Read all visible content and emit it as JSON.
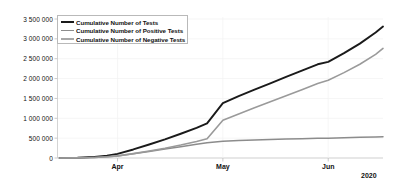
{
  "chart_data": {
    "type": "line",
    "title": "",
    "xlabel": "",
    "ylabel": "",
    "year_label": "2020",
    "ylim": [
      0,
      3500000
    ],
    "grid": true,
    "legend_position": "upper-left-inside",
    "y_ticks": [
      "0",
      "500 000",
      "1 000 000",
      "1 500 000",
      "2 000 000",
      "2 500 000",
      "3 000 000",
      "3 500 000"
    ],
    "y_tick_values": [
      0,
      500000,
      1000000,
      1500000,
      2000000,
      2500000,
      3000000,
      3500000
    ],
    "x_ticks": [
      "Apr",
      "May",
      "Jun"
    ],
    "x_tick_values": [
      1.0,
      2.0,
      3.0
    ],
    "x_range": [
      0.43,
      3.52
    ],
    "series": [
      {
        "name": "Cumulative Number of Tests",
        "color": "#1a1a1a",
        "x": [
          0.45,
          0.62,
          0.78,
          0.9,
          1.0,
          1.15,
          1.3,
          1.45,
          1.6,
          1.75,
          1.85,
          2.0,
          2.15,
          2.3,
          2.45,
          2.6,
          2.75,
          2.9,
          3.0,
          3.15,
          3.3,
          3.45,
          3.52
        ],
        "values": [
          2000,
          8000,
          28000,
          60000,
          105000,
          215000,
          340000,
          470000,
          610000,
          760000,
          870000,
          1380000,
          1560000,
          1720000,
          1880000,
          2040000,
          2200000,
          2360000,
          2420000,
          2640000,
          2880000,
          3160000,
          3310000
        ]
      },
      {
        "name": "Cumulative Number of Positive Tests",
        "color": "#8c8c8c",
        "x": [
          0.45,
          0.62,
          0.78,
          0.9,
          1.0,
          1.15,
          1.3,
          1.45,
          1.6,
          1.75,
          1.85,
          2.0,
          2.15,
          2.3,
          2.45,
          2.6,
          2.75,
          2.9,
          3.0,
          3.15,
          3.3,
          3.45,
          3.52
        ],
        "values": [
          1000,
          4000,
          14000,
          30000,
          52000,
          105000,
          165000,
          225000,
          285000,
          345000,
          385000,
          420000,
          440000,
          455000,
          468000,
          478000,
          487000,
          495000,
          500000,
          510000,
          520000,
          530000,
          536000
        ]
      },
      {
        "name": "Cumulative Number of Negative Tests",
        "color": "#9a9a9a",
        "x": [
          0.45,
          0.62,
          0.78,
          0.9,
          1.0,
          1.15,
          1.3,
          1.45,
          1.6,
          1.75,
          1.85,
          2.0,
          2.15,
          2.3,
          2.45,
          2.6,
          2.75,
          2.9,
          3.0,
          3.15,
          3.3,
          3.45,
          3.52
        ],
        "values": [
          1000,
          4000,
          14000,
          30000,
          53000,
          110000,
          175000,
          245000,
          325000,
          415000,
          485000,
          950000,
          1110000,
          1265000,
          1415000,
          1565000,
          1720000,
          1875000,
          1960000,
          2150000,
          2360000,
          2610000,
          2760000
        ]
      }
    ]
  },
  "legend": {
    "items": [
      {
        "label": "Cumulative Number of Tests",
        "color": "#1a1a1a"
      },
      {
        "label": "Cumulative Number of Positive Tests",
        "color": "#8c8c8c"
      },
      {
        "label": "Cumulative Number of Negative Tests",
        "color": "#a8a8a8"
      }
    ]
  },
  "axis": {
    "line_color": "#c9c9c9",
    "tick_color": "#bdbdbd"
  }
}
